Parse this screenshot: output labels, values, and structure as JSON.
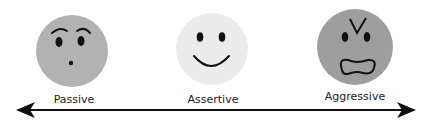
{
  "diagram": {
    "type": "behavior-spectrum",
    "points": [
      {
        "label": "Passive",
        "expression": "worried",
        "face_color": "#b2b2b2"
      },
      {
        "label": "Assertive",
        "expression": "smiling",
        "face_color": "#ececec"
      },
      {
        "label": "Aggressive",
        "expression": "angry",
        "face_color": "#9e9e9e"
      }
    ],
    "axis": {
      "direction": "bidirectional",
      "line_color": "#111111"
    }
  }
}
